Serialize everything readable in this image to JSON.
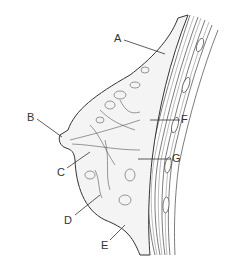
{
  "diagram": {
    "type": "anatomical-cross-section",
    "labels": [
      {
        "id": "A",
        "text": "A",
        "x": 114,
        "y": 33
      },
      {
        "id": "B",
        "text": "B",
        "x": 27,
        "y": 112
      },
      {
        "id": "C",
        "text": "C",
        "x": 57,
        "y": 167
      },
      {
        "id": "D",
        "text": "D",
        "x": 64,
        "y": 215
      },
      {
        "id": "E",
        "text": "E",
        "x": 101,
        "y": 240
      },
      {
        "id": "F",
        "text": "F",
        "x": 181,
        "y": 114
      },
      {
        "id": "G",
        "text": "G",
        "x": 172,
        "y": 153
      }
    ],
    "colors": {
      "ink": "#333333",
      "fill": "#f4f4f4",
      "background": "#ffffff"
    }
  }
}
